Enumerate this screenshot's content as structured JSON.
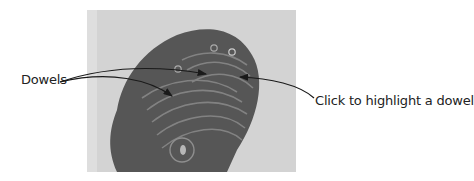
{
  "figure": {
    "callouts": [
      {
        "id": "dowels",
        "text": "Dowels"
      },
      {
        "id": "click-hint",
        "text": "Click to highlight a dowel"
      }
    ],
    "colors": {
      "photo_background": "#d3d3d3",
      "object": "#565656",
      "ridges": "#8e8e8e",
      "arrow": "#1a1a1a"
    }
  }
}
